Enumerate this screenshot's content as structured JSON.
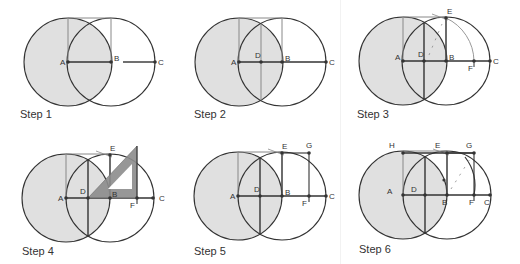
{
  "figure": {
    "colors": {
      "shade": "#e0e0e0",
      "stroke": "#333333",
      "construction": "#888888",
      "arc": "#999999",
      "set_square": "#8c8c8c"
    },
    "steps": [
      {
        "label": "Step 1",
        "label_pos": [
          20,
          108
        ],
        "circleA": [
          68,
          62
        ],
        "circleB": [
          111,
          62
        ],
        "r": 44,
        "points": [
          {
            "name": "A",
            "x": 68,
            "y": 62,
            "lx": -8,
            "ly": 3
          },
          {
            "name": "B",
            "x": 111,
            "y": 62,
            "lx": 3,
            "ly": -1
          },
          {
            "name": "C",
            "x": 155,
            "y": 62,
            "lx": 3,
            "ly": 3
          }
        ]
      },
      {
        "label": "Step 2",
        "label_pos": [
          194,
          108
        ],
        "circleA": [
          239,
          62
        ],
        "circleB": [
          282,
          62
        ],
        "r": 44,
        "points": [
          {
            "name": "A",
            "x": 239,
            "y": 62,
            "lx": -8,
            "ly": 3
          },
          {
            "name": "D",
            "x": 261,
            "y": 62,
            "lx": -6,
            "ly": -4
          },
          {
            "name": "B",
            "x": 282,
            "y": 62,
            "lx": 3,
            "ly": -1
          },
          {
            "name": "C",
            "x": 326,
            "y": 62,
            "lx": 3,
            "ly": 3
          }
        ]
      },
      {
        "label": "Step 3",
        "label_pos": [
          357,
          108
        ],
        "circleA": [
          403,
          61
        ],
        "circleB": [
          446,
          61
        ],
        "r": 44,
        "points": [
          {
            "name": "A",
            "x": 403,
            "y": 61,
            "lx": -8,
            "ly": -1
          },
          {
            "name": "D",
            "x": 424,
            "y": 61,
            "lx": -6,
            "ly": -4
          },
          {
            "name": "B",
            "x": 446,
            "y": 61,
            "lx": 3,
            "ly": -1
          },
          {
            "name": "E",
            "x": 446,
            "y": 18,
            "lx": 1,
            "ly": -4
          },
          {
            "name": "F",
            "x": 474,
            "y": 61,
            "lx": -6,
            "ly": 10
          },
          {
            "name": "C",
            "x": 490,
            "y": 61,
            "lx": 3,
            "ly": 3
          }
        ]
      },
      {
        "label": "Step 4",
        "label_pos": [
          22,
          245
        ],
        "circleA": [
          66,
          198
        ],
        "circleB": [
          110,
          198
        ],
        "r": 44,
        "points": [
          {
            "name": "A",
            "x": 66,
            "y": 198,
            "lx": -8,
            "ly": 3
          },
          {
            "name": "D",
            "x": 88,
            "y": 198,
            "lx": -8,
            "ly": -4
          },
          {
            "name": "B",
            "x": 110,
            "y": 198,
            "lx": 2,
            "ly": -1
          },
          {
            "name": "E",
            "x": 110,
            "y": 155,
            "lx": 0,
            "ly": -4
          },
          {
            "name": "F",
            "x": 137,
            "y": 198,
            "lx": -7,
            "ly": 10
          },
          {
            "name": "C",
            "x": 153,
            "y": 198,
            "lx": 6,
            "ly": 3
          }
        ]
      },
      {
        "label": "Step 5",
        "label_pos": [
          194,
          245
        ],
        "circleA": [
          238,
          196
        ],
        "circleB": [
          282,
          196
        ],
        "r": 44,
        "points": [
          {
            "name": "A",
            "x": 238,
            "y": 196,
            "lx": -8,
            "ly": 3
          },
          {
            "name": "D",
            "x": 260,
            "y": 196,
            "lx": -6,
            "ly": -4
          },
          {
            "name": "B",
            "x": 282,
            "y": 196,
            "lx": 3,
            "ly": -1
          },
          {
            "name": "E",
            "x": 282,
            "y": 153,
            "lx": 0,
            "ly": -4
          },
          {
            "name": "G",
            "x": 309,
            "y": 153,
            "lx": -3,
            "ly": -5
          },
          {
            "name": "F",
            "x": 309,
            "y": 196,
            "lx": -7,
            "ly": 10
          },
          {
            "name": "C",
            "x": 326,
            "y": 196,
            "lx": 3,
            "ly": 3
          }
        ]
      },
      {
        "label": "Step 6",
        "label_pos": [
          359,
          243
        ],
        "circleA": [
          403,
          195
        ],
        "circleB": [
          447,
          195
        ],
        "r": 44,
        "points": [
          {
            "name": "A",
            "x": 403,
            "y": 195,
            "lx": -16,
            "ly": -1
          },
          {
            "name": "D",
            "x": 425,
            "y": 195,
            "lx": -14,
            "ly": -3
          },
          {
            "name": "B",
            "x": 447,
            "y": 195,
            "lx": -5,
            "ly": 10
          },
          {
            "name": "F",
            "x": 474,
            "y": 195,
            "lx": -5,
            "ly": 10
          },
          {
            "name": "C",
            "x": 490,
            "y": 195,
            "lx": -6,
            "ly": 10
          },
          {
            "name": "H",
            "x": 403,
            "y": 153,
            "lx": -14,
            "ly": -5
          },
          {
            "name": "E",
            "x": 447,
            "y": 153,
            "lx": -12,
            "ly": -5
          },
          {
            "name": "G",
            "x": 474,
            "y": 153,
            "lx": -8,
            "ly": -5
          }
        ]
      }
    ]
  }
}
